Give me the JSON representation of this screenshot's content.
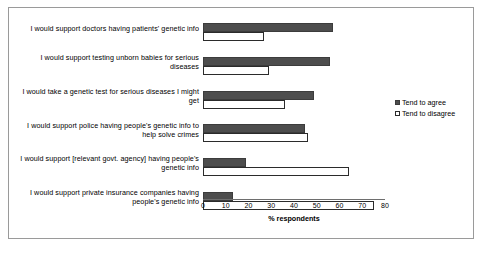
{
  "chart_data": {
    "type": "bar",
    "title": "",
    "xlabel": "% respondents",
    "ylabel": "",
    "xlim": [
      0,
      80
    ],
    "xticks": [
      0,
      10,
      20,
      30,
      40,
      50,
      60,
      70,
      80
    ],
    "grid": false,
    "legend_position": "right",
    "orientation": "horizontal",
    "categories": [
      "I would support doctors having patients' genetic info",
      "I would support testing unborn babies for serious diseases",
      "I would take a genetic test for serious diseases I might get",
      "I would support police having people's genetic info to help solve crimes",
      "I would support [relevant govt. agency] having people's genetic info",
      "I would support private insurance companies having people's genetic info"
    ],
    "series": [
      {
        "name": "Tend to agree",
        "color": "#4d4d4d",
        "values": [
          57,
          56,
          49,
          45,
          19,
          13
        ]
      },
      {
        "name": "Tend to disagree",
        "color": "#ffffff",
        "values": [
          27,
          29,
          36,
          46,
          64,
          75
        ]
      }
    ]
  },
  "legend": {
    "items": [
      {
        "label": "Tend to agree"
      },
      {
        "label": "Tend to disagree"
      }
    ]
  }
}
